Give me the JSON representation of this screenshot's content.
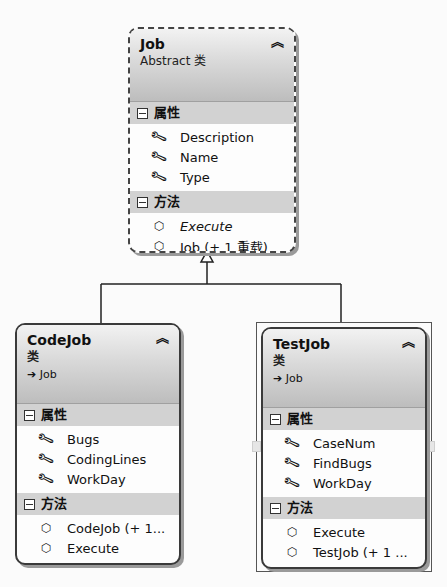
{
  "diagram": {
    "type": "class-diagram",
    "classes": [
      {
        "id": "job",
        "name": "Job",
        "kind": "Abstract 类",
        "base": null,
        "properties_label": "属性",
        "methods_label": "方法",
        "properties": [
          "Description",
          "Name",
          "Type"
        ],
        "methods": [
          {
            "name": "Execute",
            "italic": true
          },
          {
            "name": "Job (+ 1 重载)",
            "italic": false
          }
        ]
      },
      {
        "id": "codejob",
        "name": "CodeJob",
        "kind": "类",
        "base": "Job",
        "properties_label": "属性",
        "methods_label": "方法",
        "properties": [
          "Bugs",
          "CodingLines",
          "WorkDay"
        ],
        "methods": [
          {
            "name": "CodeJob (+ 1...",
            "italic": false
          },
          {
            "name": "Execute",
            "italic": false
          }
        ]
      },
      {
        "id": "testjob",
        "name": "TestJob",
        "kind": "类",
        "base": "Job",
        "selected": true,
        "properties_label": "属性",
        "methods_label": "方法",
        "properties": [
          "CaseNum",
          "FindBugs",
          "WorkDay"
        ],
        "methods": [
          {
            "name": "Execute",
            "italic": false
          },
          {
            "name": "TestJob (+ 1 ...",
            "italic": false
          }
        ]
      }
    ],
    "relations": [
      {
        "type": "inheritance",
        "from": "CodeJob",
        "to": "Job"
      },
      {
        "type": "inheritance",
        "from": "TestJob",
        "to": "Job"
      }
    ],
    "icons": {
      "collapse": "double-chevron-up-icon",
      "section_toggle": "minus-box-icon",
      "property": "wrench-icon",
      "method": "cube-icon",
      "base_arrow": "arrow-right-icon"
    },
    "glyphs": {
      "collapse": "⌃",
      "wrench": "🔧",
      "cube": "⬡",
      "arrow": "➔"
    }
  }
}
